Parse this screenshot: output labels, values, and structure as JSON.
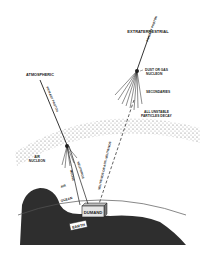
{
  "diagram": {
    "colors": {
      "background": "#ffffff",
      "ink": "#1e1e1e",
      "earth": "#333333",
      "atmosphere": "#9a9a9a"
    },
    "labels": {
      "extraterrestrial": "EXTRATERRESTRIAL",
      "primary_proton_extra": "PRIMARY PROTON",
      "dust_or_gas_nucleon_1": "DUST OR GAS",
      "dust_or_gas_nucleon_2": "NUCLEON",
      "secondaries": "SECONDARIES",
      "all_unstable_1": "ALL UNSTABLE",
      "all_unstable_2": "PARTICLES DECAY",
      "atmospheric": "ATMOSPHERIC",
      "primary_proton_atmo": "PRIMARY PROTON",
      "air_nucleon_1": "AIR",
      "air_nucleon_2": "NUCLEON",
      "air": "AIR",
      "muons": "MUONS",
      "neutrinos": "NEUTRINOS",
      "neutrinos_or_anti": "NEUTRINOS OR ANTI-NEUTRINOS",
      "ocean": "OCEAN",
      "dumand": "DUMAND",
      "earth": "EARTH"
    }
  }
}
